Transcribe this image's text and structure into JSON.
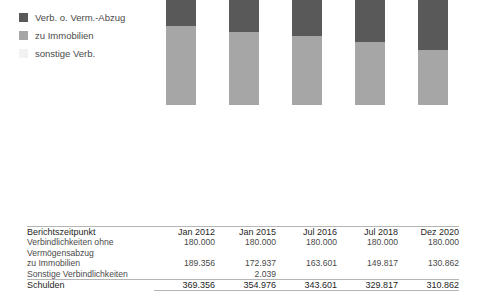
{
  "legend": {
    "items": [
      {
        "label": "Verb. o. Verm.-Abzug",
        "color": "#595959",
        "icon": "legend-swatch"
      },
      {
        "label": "zu Immobilien",
        "color": "#a6a6a6",
        "icon": "legend-swatch"
      },
      {
        "label": "sonstige Verb.",
        "color": "#f2f2f2",
        "icon": "legend-swatch"
      }
    ]
  },
  "table": {
    "header_label": "Berichtszeitpunkt",
    "columns": [
      "Jan 2012",
      "Jan 2015",
      "Jul 2016",
      "Jul 2018",
      "Dez 2020"
    ],
    "rows": [
      {
        "label": "Verbindlichkeiten ohne",
        "label_cont": "Vermögensabzug",
        "values": [
          "180.000",
          "180.000",
          "180.000",
          "180.000",
          "180.000"
        ]
      },
      {
        "label": "zu Immobilien",
        "values": [
          "189.356",
          "172.937",
          "163.601",
          "149.817",
          "130.862"
        ]
      },
      {
        "label": "Sonstige Verbindlichkeiten",
        "values": [
          "",
          "2.039",
          "",
          "",
          ""
        ]
      }
    ],
    "total": {
      "label": "Schulden",
      "values": [
        "369.356",
        "354.976",
        "343.601",
        "329.817",
        "310.862"
      ]
    }
  },
  "chart_data": {
    "type": "bar",
    "subtype": "stacked-column",
    "title": "",
    "xlabel": "",
    "ylabel": "",
    "grid": false,
    "legend_position": "top-left",
    "categories": [
      "Jan 2012",
      "Jan 2015",
      "Jul 2016",
      "Jul 2018",
      "Dez 2020"
    ],
    "series": [
      {
        "name": "Verb. o. Verm.-Abzug",
        "color": "#595959",
        "values": [
          180000,
          180000,
          180000,
          180000,
          180000
        ]
      },
      {
        "name": "zu Immobilien",
        "color": "#a6a6a6",
        "values": [
          189356,
          172937,
          163601,
          149817,
          130862
        ]
      },
      {
        "name": "sonstige Verb.",
        "color": "#f2f2f2",
        "values": [
          0,
          2039,
          0,
          0,
          0
        ]
      }
    ],
    "totals": [
      369356,
      354976,
      343601,
      329817,
      310862
    ],
    "ylim": [
      0,
      380000
    ]
  },
  "geometry": {
    "baseline_y": 197,
    "bar_width": 30,
    "bar_x": [
      166,
      229,
      292,
      355,
      418
    ],
    "px_per_unit": 0.0004198
  }
}
